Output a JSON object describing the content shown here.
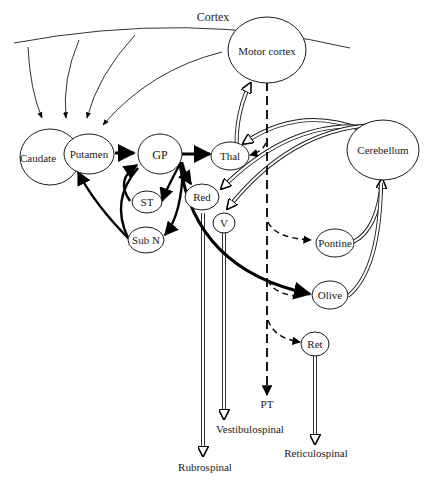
{
  "diagram": {
    "title": "Cortex",
    "nodes": {
      "motor_cortex": "Motor cortex",
      "caudate": "Caudate",
      "putamen": "Putamen",
      "gp": "GP",
      "thal": "Thal",
      "cerebellum": "Cerebellum",
      "st": "ST",
      "red": "Red",
      "v": "V",
      "sub_n": "Sub N",
      "pontine": "Pontine",
      "olive": "Olive",
      "ret": "Ret"
    },
    "outputs": {
      "pt": "PT",
      "vestibulospinal": "Vestibulospinal",
      "rubrospinal": "Rubrospinal",
      "reticulospinal": "Reticulospinal"
    },
    "connections": [
      {
        "from": "Cortex",
        "to": "Caudate",
        "style": "thin"
      },
      {
        "from": "Cortex",
        "to": "Putamen",
        "style": "thin"
      },
      {
        "from": "Motor cortex",
        "to": "Putamen",
        "style": "thin"
      },
      {
        "from": "Putamen",
        "to": "GP",
        "style": "thick"
      },
      {
        "from": "GP",
        "to": "Thal",
        "style": "thick"
      },
      {
        "from": "GP",
        "to": "ST",
        "style": "thick"
      },
      {
        "from": "ST",
        "to": "GP",
        "style": "thick"
      },
      {
        "from": "GP",
        "to": "Red",
        "style": "thick"
      },
      {
        "from": "GP",
        "to": "Sub N",
        "style": "thick"
      },
      {
        "from": "Sub N",
        "to": "Putamen",
        "style": "thick"
      },
      {
        "from": "Sub N",
        "to": "GP",
        "style": "thick"
      },
      {
        "from": "GP",
        "to": "Olive",
        "style": "thick"
      },
      {
        "from": "Thal",
        "to": "Motor cortex",
        "style": "double"
      },
      {
        "from": "Cerebellum",
        "to": "Thal",
        "style": "double"
      },
      {
        "from": "Cerebellum",
        "to": "Red",
        "style": "double"
      },
      {
        "from": "Cerebellum",
        "to": "V",
        "style": "double"
      },
      {
        "from": "Pontine",
        "to": "Cerebellum",
        "style": "double"
      },
      {
        "from": "Olive",
        "to": "Cerebellum",
        "style": "double"
      },
      {
        "from": "Motor cortex",
        "to": "PT",
        "style": "dashed"
      },
      {
        "from": "Motor cortex",
        "to": "Thal",
        "style": "dashed"
      },
      {
        "from": "Motor cortex",
        "to": "Pontine",
        "style": "dashed"
      },
      {
        "from": "Motor cortex",
        "to": "Olive",
        "style": "dashed"
      },
      {
        "from": "Motor cortex",
        "to": "Ret",
        "style": "dashed"
      },
      {
        "from": "Red",
        "to": "Rubrospinal",
        "style": "double"
      },
      {
        "from": "V",
        "to": "Vestibulospinal",
        "style": "double"
      },
      {
        "from": "Ret",
        "to": "Reticulospinal",
        "style": "double"
      }
    ]
  }
}
